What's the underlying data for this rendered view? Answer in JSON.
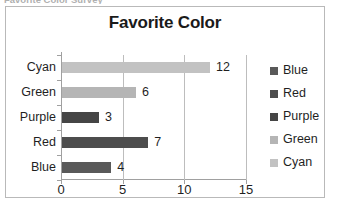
{
  "clipped_caption": "Favorite Color Survey",
  "chart_data": {
    "type": "bar",
    "orientation": "horizontal",
    "title": "Favorite Color",
    "xlabel": "",
    "ylabel": "",
    "categories": [
      "Blue",
      "Red",
      "Purple",
      "Green",
      "Cyan"
    ],
    "values": [
      4,
      7,
      3,
      6,
      12
    ],
    "data_labels": [
      "4",
      "7",
      "3",
      "6",
      "12"
    ],
    "display_order_top_to_bottom": [
      "Cyan",
      "Green",
      "Purple",
      "Red",
      "Blue"
    ],
    "xlim": [
      0,
      15
    ],
    "xticks": [
      0,
      5,
      10,
      15
    ],
    "xtick_labels": [
      "0",
      "5",
      "10",
      "15"
    ],
    "grid": "vertical",
    "legend_position": "right",
    "legend": [
      {
        "label": "Blue",
        "color": "#595959"
      },
      {
        "label": "Red",
        "color": "#4d4d4d"
      },
      {
        "label": "Purple",
        "color": "#454545"
      },
      {
        "label": "Green",
        "color": "#b5b5b5"
      },
      {
        "label": "Cyan",
        "color": "#c2c2c2"
      }
    ],
    "bar_colors": {
      "Blue": "#595959",
      "Red": "#4d4d4d",
      "Purple": "#454545",
      "Green": "#b5b5b5",
      "Cyan": "#c2c2c2"
    }
  }
}
